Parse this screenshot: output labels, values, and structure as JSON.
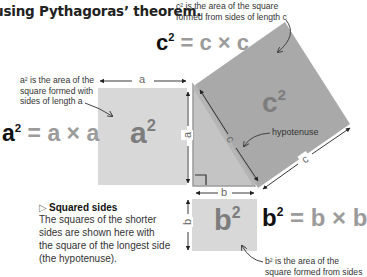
{
  "headline": "using Pythagoras’ theorem.",
  "colors": {
    "square_a": "#d8d8d8",
    "square_b": "#d8d8d8",
    "square_c": "#a9a9a9",
    "triangle": "#c4c4c4",
    "hypotenuse_stroke": "#9a9a9a",
    "formula_text": "#9b9b9b",
    "formula_lead": "#111111",
    "square_label": "#7d7d7d"
  },
  "notes": {
    "c_note": [
      "c² is the area of the square",
      "formed from sides of length c"
    ],
    "a_note": [
      "a² is the area of the",
      "square formed with",
      "sides of length a"
    ],
    "b_note": [
      "b² is the area of the",
      "square formed from sides"
    ],
    "hypotenuse": "hypotenuse"
  },
  "formulas": {
    "c": {
      "lead": "c",
      "sup": "2",
      "rest": " = c × c"
    },
    "a": {
      "lead": "a",
      "sup": "2",
      "rest": " = a × a"
    },
    "b": {
      "lead": "b",
      "sup": "2",
      "rest": " = b × b"
    }
  },
  "squares": {
    "a": {
      "label": "a",
      "sup": "2"
    },
    "b": {
      "label": "b",
      "sup": "2"
    },
    "c": {
      "label": "c",
      "sup": "2"
    }
  },
  "dimensions": {
    "a_top": "a",
    "a_side": "a",
    "b_bottom": "b",
    "b_side": "b",
    "c_hyp": "c",
    "c_outer": "c"
  },
  "caption": {
    "icon": "▷",
    "title": "Squared sides",
    "lines": [
      "The squares of the shorter",
      "sides are shown here with",
      "the square of the longest side",
      "(the hypotenuse)."
    ]
  }
}
